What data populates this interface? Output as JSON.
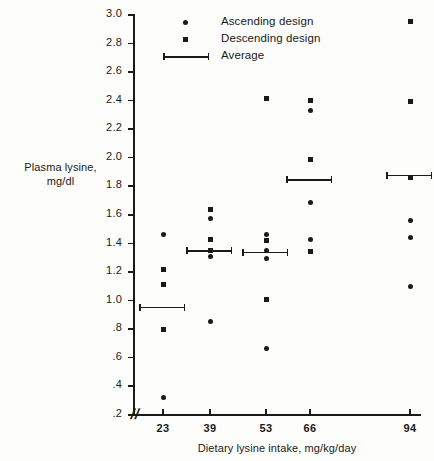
{
  "chart_data": {
    "type": "scatter",
    "title": "",
    "xlabel": "Dietary lysine intake, mg/kg/day",
    "ylabel_line1": "Plasma lysine,",
    "ylabel_line2": "mg/dl",
    "ylim": [
      0.2,
      3.0
    ],
    "ytick_labels": [
      "3.0",
      "2.8",
      "2.6",
      "2.4",
      "2.2",
      "2.0",
      "1.8",
      "1.6",
      "1.4",
      "1.2",
      "1.0",
      ".8",
      ".6",
      ".4",
      ".2"
    ],
    "ytick_values": [
      3.0,
      2.8,
      2.6,
      2.4,
      2.2,
      2.0,
      1.8,
      1.6,
      1.4,
      1.2,
      1.0,
      0.8,
      0.6,
      0.4,
      0.2
    ],
    "xtick_labels": [
      "23",
      "39",
      "53",
      "66",
      "94"
    ],
    "xtick_values": [
      23,
      39,
      53,
      66,
      94
    ],
    "axis_break_symbol": "//",
    "grid": false,
    "legend_position": "top-center",
    "legend": [
      {
        "label": "Ascending design",
        "marker": "circle"
      },
      {
        "label": "Descending design",
        "marker": "square"
      },
      {
        "label": "Average",
        "marker": "capped-line"
      }
    ],
    "series": [
      {
        "name": "Ascending design",
        "marker": "circle",
        "points": [
          {
            "x": 23,
            "y": 1.455
          },
          {
            "x": 23,
            "y": 0.315
          },
          {
            "x": 39,
            "y": 1.57
          },
          {
            "x": 39,
            "y": 1.345
          },
          {
            "x": 39,
            "y": 1.3
          },
          {
            "x": 39,
            "y": 0.85
          },
          {
            "x": 53,
            "y": 1.455
          },
          {
            "x": 53,
            "y": 1.345
          },
          {
            "x": 53,
            "y": 1.29
          },
          {
            "x": 53,
            "y": 0.66
          },
          {
            "x": 66,
            "y": 2.325
          },
          {
            "x": 66,
            "y": 1.68
          },
          {
            "x": 66,
            "y": 1.42
          },
          {
            "x": 94,
            "y": 1.555
          },
          {
            "x": 94,
            "y": 1.435
          },
          {
            "x": 94,
            "y": 1.09
          }
        ]
      },
      {
        "name": "Descending design",
        "marker": "square",
        "points": [
          {
            "x": 23,
            "y": 1.215
          },
          {
            "x": 23,
            "y": 1.11
          },
          {
            "x": 23,
            "y": 0.795
          },
          {
            "x": 39,
            "y": 1.63
          },
          {
            "x": 39,
            "y": 1.425
          },
          {
            "x": 39,
            "y": 1.345
          },
          {
            "x": 53,
            "y": 2.41
          },
          {
            "x": 53,
            "y": 1.415
          },
          {
            "x": 53,
            "y": 1.005
          },
          {
            "x": 66,
            "y": 2.395
          },
          {
            "x": 66,
            "y": 1.98
          },
          {
            "x": 66,
            "y": 1.335
          },
          {
            "x": 94,
            "y": 2.95
          },
          {
            "x": 94,
            "y": 2.385
          },
          {
            "x": 94,
            "y": 1.855
          }
        ]
      }
    ],
    "averages": [
      {
        "x": 23,
        "y": 0.95
      },
      {
        "x": 39,
        "y": 1.345
      },
      {
        "x": 53,
        "y": 1.335
      },
      {
        "x": 66,
        "y": 1.845
      },
      {
        "x": 94,
        "y": 1.875
      }
    ]
  }
}
